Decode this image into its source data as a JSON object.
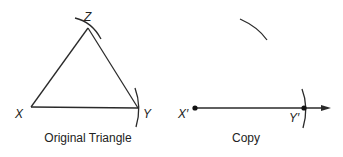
{
  "original": {
    "caption": "Original Triangle",
    "vertices": {
      "X": {
        "label": "X",
        "x": 31,
        "y": 107
      },
      "Y": {
        "label": "Y",
        "x": 138,
        "y": 108
      },
      "Z": {
        "label": "Z",
        "x": 88,
        "y": 28
      }
    }
  },
  "copy": {
    "caption": "Copy",
    "points": {
      "X_prime": {
        "label": "X′",
        "x": 195,
        "y": 108
      },
      "Y_prime": {
        "label": "Y′",
        "x": 304,
        "y": 108
      }
    }
  },
  "colors": {
    "stroke": "#2a2a2a",
    "text": "#222222",
    "background": "#ffffff"
  }
}
